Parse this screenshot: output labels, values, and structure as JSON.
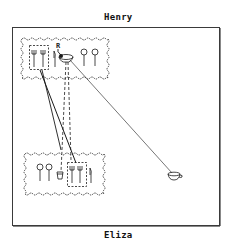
{
  "top_label": "Henry",
  "bottom_label": "Eliza",
  "marker_label": "R",
  "colors": {
    "ink": "#1a1a1a",
    "frame": "#3a3a3a",
    "background": "#ffffff"
  },
  "zones": [
    {
      "owner": "Henry",
      "items": [
        "fork",
        "fork",
        "knife",
        "cup",
        "glass",
        "glass"
      ],
      "grouped": [
        "fork",
        "fork"
      ]
    },
    {
      "owner": "Eliza",
      "items": [
        "glass",
        "glass",
        "cup",
        "fork",
        "fork",
        "knife"
      ],
      "grouped": [
        "fork",
        "fork"
      ]
    }
  ],
  "loose_items": [
    "teacup"
  ],
  "connections": [
    {
      "from": "Henry forks group",
      "to": "Eliza forks group",
      "style": "solid"
    },
    {
      "from": "Henry cup",
      "to": "Eliza cup",
      "style": "dashed"
    },
    {
      "from": "Henry cup",
      "to": "teacup",
      "style": "thin solid"
    }
  ]
}
